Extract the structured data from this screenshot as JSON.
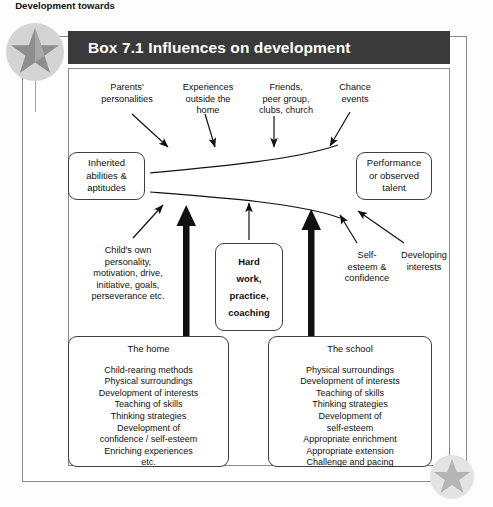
{
  "figure": {
    "box_number": "Box 7.1",
    "title": "Box 7.1 Influences on development",
    "decorations": {
      "top_star": "star-icon",
      "bottom_star": "star-icon"
    }
  },
  "top_influences": [
    {
      "id": "parents",
      "lines": [
        "Parents'",
        "personalities"
      ]
    },
    {
      "id": "experiences",
      "lines": [
        "Experiences",
        "outside the",
        "home"
      ]
    },
    {
      "id": "friends",
      "lines": [
        "Friends,",
        "peer group,",
        "clubs, church"
      ]
    },
    {
      "id": "chance",
      "lines": [
        "Chance",
        "events"
      ]
    }
  ],
  "input_box": {
    "lines": [
      "Inherited",
      "abilities &",
      "aptitudes"
    ]
  },
  "output_box": {
    "lines": [
      "Performance",
      "or observed",
      "talent"
    ]
  },
  "funnel_label": "Development towards",
  "bottom_influences": [
    {
      "id": "child-own",
      "lines": [
        "Child's own",
        "personality,",
        "motivation, drive,",
        "initiative, goals,",
        "perseverance etc."
      ]
    },
    {
      "id": "self-esteem",
      "lines": [
        "Self-",
        "esteem &",
        "confidence"
      ]
    },
    {
      "id": "developing-interests",
      "lines": [
        "Developing",
        "interests"
      ]
    }
  ],
  "effort_box": {
    "lines": [
      "Hard",
      "work,",
      "practice,",
      "coaching"
    ]
  },
  "home_box": {
    "title": "The home",
    "items": [
      "Child-rearing methods",
      "Physical surroundings",
      "Development of interests",
      "Teaching of skills",
      "Thinking strategies",
      "Development of",
      "confidence / self-esteem",
      "Enriching experiences",
      "etc."
    ]
  },
  "school_box": {
    "title": "The school",
    "items": [
      "Physical surroundings",
      "Development of interests",
      "Teaching of skills",
      "Thinking strategies",
      "Development of",
      "self-esteem",
      "Appropriate enrichment",
      "Appropriate extension",
      "Challenge and pacing"
    ]
  },
  "colors": {
    "title_bar": "#3a3a3a",
    "title_text": "#ffffff",
    "frame": "#8a8a8a",
    "box_border": "#3f3f3f",
    "arrow": "#111111",
    "star_top": "#d4d4d4",
    "star_bottom": "#e3e3e3"
  }
}
